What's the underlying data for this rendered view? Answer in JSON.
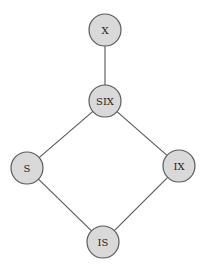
{
  "diagram": {
    "type": "lock-mode-hierarchy",
    "nodes": [
      {
        "id": "X",
        "label": "X",
        "cx": 105,
        "cy": 30,
        "r": 16
      },
      {
        "id": "SIX",
        "label": "SIX",
        "cx": 105,
        "cy": 101,
        "r": 16
      },
      {
        "id": "S",
        "label": "S",
        "cx": 27,
        "cy": 168,
        "r": 16
      },
      {
        "id": "IX",
        "label": "IX",
        "cx": 179,
        "cy": 166,
        "r": 16
      },
      {
        "id": "IS",
        "label": "IS",
        "cx": 103,
        "cy": 242,
        "r": 16
      }
    ],
    "edges": [
      {
        "from": "X",
        "to": "SIX"
      },
      {
        "from": "SIX",
        "to": "S"
      },
      {
        "from": "SIX",
        "to": "IX"
      },
      {
        "from": "S",
        "to": "IS"
      },
      {
        "from": "IX",
        "to": "IS"
      }
    ],
    "colors": {
      "node_fill": "#d9d9d9",
      "node_stroke": "#5a5a5a",
      "edge": "#555555",
      "background": "#ffffff"
    }
  }
}
